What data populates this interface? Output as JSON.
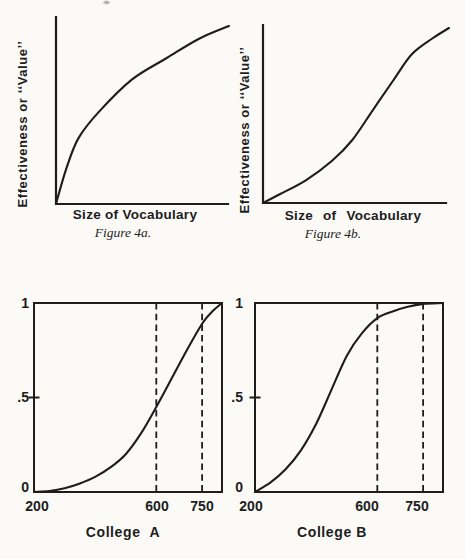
{
  "colors": {
    "paper": "#fbfaf7",
    "ink": "#1d1d1d"
  },
  "chart_data": [
    {
      "id": "figure-4a",
      "type": "line",
      "caption": "Figure 4a.",
      "xlabel": "Size of Vocabulary",
      "ylabel": "Effectiveness or ‘‘Value’’",
      "shape_note": "concave increasing curve (diminishing returns), unlabeled axes, open L-shaped axes",
      "xlim": [
        0,
        1
      ],
      "ylim": [
        0,
        1
      ],
      "x": [
        0,
        0.06,
        0.13,
        0.25,
        0.44,
        0.64,
        0.83,
        1
      ],
      "y": [
        0,
        0.2,
        0.37,
        0.52,
        0.7,
        0.82,
        0.93,
        1
      ]
    },
    {
      "id": "figure-4b",
      "type": "line",
      "caption": "Figure 4b.",
      "xlabel": "Size of Vocabulary",
      "ylabel": "Effectiveness or ‘‘Value’’",
      "shape_note": "S-shaped (sigmoid) increasing curve, unlabeled axes, open L-shaped axes",
      "xlim": [
        0,
        1
      ],
      "ylim": [
        0,
        1
      ],
      "x": [
        0,
        0.09,
        0.23,
        0.37,
        0.48,
        0.59,
        0.7,
        0.8,
        0.91,
        1
      ],
      "y": [
        0,
        0.05,
        0.13,
        0.24,
        0.36,
        0.53,
        0.7,
        0.85,
        0.94,
        1
      ]
    },
    {
      "id": "college-a",
      "type": "line",
      "caption": "College  A",
      "xlim": [
        200,
        815
      ],
      "ylim": [
        0,
        1
      ],
      "ytick_labels": [
        "1",
        ".5",
        "0"
      ],
      "ytick_values": [
        1,
        0.5,
        0
      ],
      "xtick_labels": [
        "200",
        "600",
        "750"
      ],
      "xtick_values": [
        200,
        600,
        750
      ],
      "dashed_vlines_x": [
        600,
        750
      ],
      "shape_note": "sigmoid cumulative curve in full box; ~0.45 at 600, ~0.89 at 750, reaches 1 at right edge",
      "x": [
        200,
        250,
        300,
        350,
        400,
        450,
        500,
        550,
        600,
        650,
        700,
        750,
        780,
        815
      ],
      "y": [
        0,
        0.005,
        0.02,
        0.045,
        0.08,
        0.13,
        0.2,
        0.31,
        0.45,
        0.6,
        0.75,
        0.89,
        0.95,
        1
      ]
    },
    {
      "id": "college-b",
      "type": "line",
      "caption": "College B",
      "xlim": [
        200,
        815
      ],
      "ylim": [
        0,
        1
      ],
      "ytick_labels": [
        "1",
        ".5",
        "0"
      ],
      "ytick_values": [
        1,
        0.5,
        0
      ],
      "xtick_labels": [
        "200",
        "600",
        "750"
      ],
      "xtick_values": [
        200,
        600,
        750
      ],
      "dashed_vlines_x": [
        600,
        750
      ],
      "shape_note": "sigmoid cumulative curve in full box; ~0.92 at 600, ~0.99 at 750, flattens along top border",
      "x": [
        200,
        250,
        300,
        350,
        400,
        450,
        500,
        550,
        600,
        650,
        700,
        750,
        815
      ],
      "y": [
        0,
        0.05,
        0.12,
        0.22,
        0.36,
        0.54,
        0.72,
        0.84,
        0.92,
        0.955,
        0.98,
        0.995,
        1
      ]
    }
  ]
}
